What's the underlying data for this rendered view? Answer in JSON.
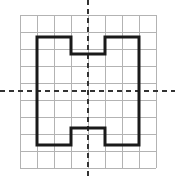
{
  "figure": {
    "type": "coordinate-grid-figure",
    "title": "",
    "canvas": {
      "width": 175,
      "height": 180,
      "background": "#ffffff"
    },
    "grid": {
      "label": "square grid",
      "columns": 8,
      "rows": 9,
      "cell_size": 17,
      "origin_x": 20,
      "origin_y": 15,
      "right": 156,
      "bottom": 168,
      "color": "#b3b3b3",
      "stroke_width": 1,
      "visible": true,
      "x_lines": [
        20,
        37,
        54,
        71,
        88,
        105,
        122,
        139,
        156
      ],
      "y_lines": [
        15,
        32,
        49,
        66,
        83,
        100,
        117,
        134,
        151,
        168
      ]
    },
    "axes": {
      "label": "dashed symmetry axes",
      "color": "#333333",
      "stroke_width": 2,
      "dash_pattern": "5 4",
      "vertical": {
        "name": "vertical-axis",
        "x": 88,
        "y_start": 0,
        "y_end": 180
      },
      "horizontal": {
        "name": "horizontal-axis",
        "y": 91,
        "x_start": 0,
        "x_end": 175
      }
    },
    "shape": {
      "name": "h-beam-polygon",
      "description": "I-beam / H shaped outline with top and bottom notches",
      "color": "#1a1a1a",
      "stroke_width": 3,
      "fill": "none",
      "bounds": {
        "left": 37,
        "top": 37,
        "right": 139,
        "bottom": 145
      },
      "notch_top": {
        "left": 71,
        "right": 105,
        "depth_y": 54
      },
      "notch_bottom": {
        "left": 71,
        "right": 105,
        "depth_y": 128
      },
      "points": "37,37 71,37 71,54 105,54 105,37 139,37 139,145 105,145 105,128 71,128 71,145 37,145"
    }
  },
  "chart_data": {
    "type": "scatter",
    "title": "",
    "xlabel": "",
    "ylabel": "",
    "grid": true,
    "legend": "none",
    "xlim": [
      -4,
      4
    ],
    "ylim": [
      -4.5,
      4.5
    ],
    "series": [
      {
        "name": "H-shape outline vertices (grid units, origin at axes crossing)",
        "x": [
          -3,
          -1,
          -1,
          1,
          1,
          3,
          3,
          1,
          1,
          -1,
          -1,
          -3
        ],
        "y": [
          3.2,
          3.2,
          2.2,
          2.2,
          3.2,
          3.2,
          -3.2,
          -3.2,
          -2.2,
          -2.2,
          -3.2,
          -3.2
        ]
      }
    ]
  }
}
